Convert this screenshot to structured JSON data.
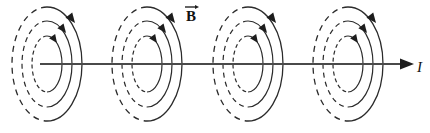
{
  "figure": {
    "background_color": "#ffffff",
    "width": 430,
    "height": 133,
    "line_color": "#2b2b2b",
    "axis_color": "#4a4a4a",
    "arrow_color": "#1d1d1d"
  },
  "labels": {
    "magnetic_field": {
      "text": "B",
      "name": "magnetic-field-vector-label",
      "bold": true,
      "has_vector_arrow": true,
      "x": 186,
      "y": 20
    },
    "current": {
      "text": "I",
      "name": "current-label",
      "italic": true,
      "x": 417,
      "y": 71
    }
  },
  "axis": {
    "name": "current-wire-axis",
    "y": 64,
    "x_start": 40,
    "x_end": 412,
    "arrow_tip_x": 413,
    "direction": "right"
  },
  "field_line_groups": [
    {
      "name": "field-line-group-1",
      "center_x": 47,
      "center_y": 64
    },
    {
      "name": "field-line-group-2",
      "center_x": 147,
      "center_y": 64
    },
    {
      "name": "field-line-group-3",
      "center_x": 248,
      "center_y": 64
    },
    {
      "name": "field-line-group-4",
      "center_x": 348,
      "center_y": 64
    }
  ],
  "ellipse_rings": [
    {
      "name": "inner-field-line",
      "rx": 15,
      "ry": 28,
      "stroke_width": 1.2,
      "dash_pattern": "4,3"
    },
    {
      "name": "middle-field-line",
      "rx": 25,
      "ry": 43,
      "stroke_width": 1.2,
      "dash_pattern": "5,4"
    },
    {
      "name": "outer-field-line",
      "rx": 35,
      "ry": 57,
      "stroke_width": 1.3,
      "dash_pattern": "6,5"
    }
  ],
  "circulation": {
    "sense": "clockwise-viewed-along-current",
    "arrowheads_per_group": 3,
    "description": "Each field line carries one arrowhead on its upper-right arc pointing down-and-right"
  }
}
